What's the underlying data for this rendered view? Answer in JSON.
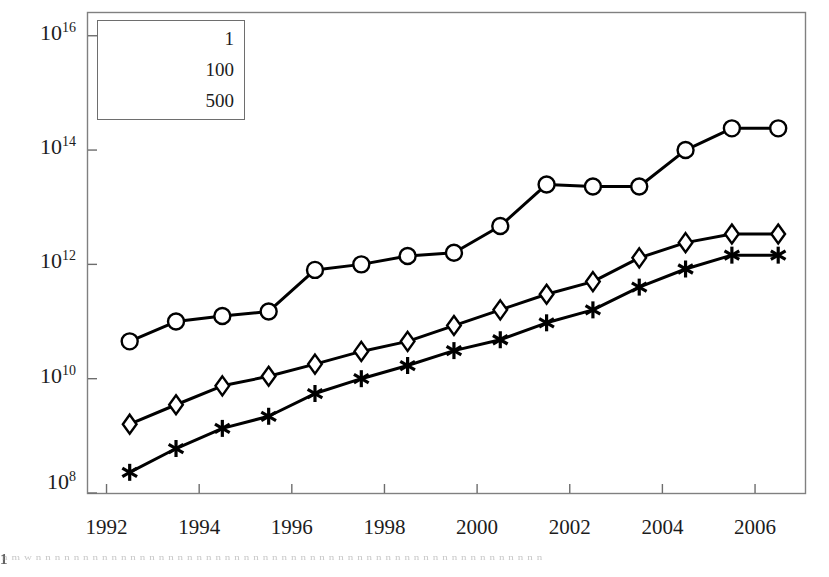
{
  "chart_data": {
    "type": "line",
    "title": "",
    "subtitle": "",
    "xlabel": "",
    "ylabel": "",
    "yscale": "log",
    "xscale": "linear",
    "xlim": [
      1991.6,
      2007.1
    ],
    "ylim": [
      100000000,
      25000000000000000
    ],
    "grid": false,
    "legend_position": "top-left inside plot area",
    "x_tick_labels": [
      "1992",
      "1994",
      "1996",
      "1998",
      "2000",
      "2002",
      "2004",
      "2006"
    ],
    "x_ticks": [
      1992,
      1994,
      1996,
      1998,
      2000,
      2002,
      2004,
      2006
    ],
    "y_tick_labels": [
      "10^8",
      "10^10",
      "10^12",
      "10^14",
      "10^16"
    ],
    "y_tick_mantissa": "10",
    "y_tick_exponents": [
      "8",
      "10",
      "12",
      "14",
      "16"
    ],
    "y_ticks": [
      100000000,
      10000000000,
      1000000000000,
      100000000000000,
      10000000000000000
    ],
    "x": [
      1992.5,
      1993.5,
      1994.5,
      1995.5,
      1996.5,
      1997.5,
      1998.5,
      1999.5,
      2000.5,
      2001.5,
      2002.5,
      2003.5,
      2004.5,
      2005.5,
      2006.5
    ],
    "series": [
      {
        "name": "1",
        "marker": "circle",
        "color": "#000000",
        "values": [
          45000000000,
          100000000000,
          125000000000,
          150000000000,
          800000000000,
          1000000000000,
          1400000000000,
          1600000000000,
          4700000000000,
          25000000000000,
          23000000000000,
          23000000000000,
          100000000000000,
          240000000000000,
          240000000000000
        ]
      },
      {
        "name": "100",
        "marker": "diamond",
        "color": "#000000",
        "values": [
          1600000000,
          3500000000,
          7500000000,
          11000000000,
          18000000000,
          30000000000,
          45000000000,
          85000000000,
          160000000000,
          300000000000,
          500000000000,
          1300000000000,
          2400000000000,
          3400000000000,
          3400000000000
        ]
      },
      {
        "name": "500",
        "marker": "asterisk",
        "color": "#000000",
        "values": [
          230000000,
          600000000,
          1350000000,
          2200000000,
          5500000000,
          10000000000,
          17000000000,
          31000000000,
          48000000000,
          95000000000,
          160000000000,
          400000000000,
          830000000000,
          1450000000000,
          1450000000000
        ]
      }
    ],
    "annotations": []
  },
  "legend": {
    "entries": [
      {
        "label": "1",
        "marker": "circle-marker"
      },
      {
        "label": "100",
        "marker": "diamond-marker"
      },
      {
        "label": "500",
        "marker": "asterisk-marker"
      }
    ]
  },
  "artifacts": {
    "bleed_corner": "1",
    "bleed_line": "n m w  n n   n  n n   n n n n n n  n n   n n  n n n   n n n   n n n n n n n   n n  n n n n  n n n n n n  n n n n n n n n  n n n n n n"
  }
}
